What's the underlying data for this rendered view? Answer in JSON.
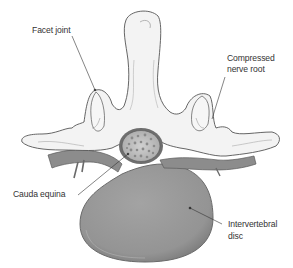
{
  "diagram": {
    "labels": {
      "facet_joint": "Facet joint",
      "compressed_nerve_root_line1": "Compressed",
      "compressed_nerve_root_line2": "nerve root",
      "cauda_equina": "Cauda equina",
      "intervertebral_disc_line1": "Intervertebral",
      "intervertebral_disc_line2": "disc"
    },
    "colors": {
      "bone_fill": "#f2f2f2",
      "bone_outline": "#555555",
      "disc_fill": "#9a9a9a",
      "disc_edge": "#6e6e6e",
      "nerve_fill": "#8a8a8a",
      "cauda_fill": "#c8c8c8",
      "leader_line": "#333333",
      "text": "#333333"
    }
  }
}
